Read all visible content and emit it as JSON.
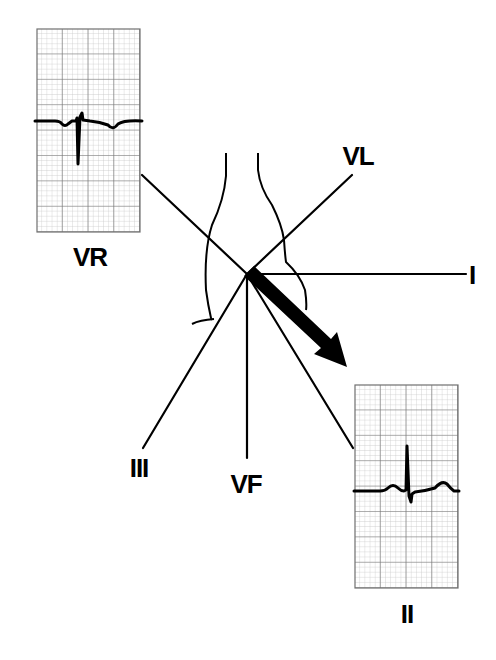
{
  "diagram": {
    "center": [
      247,
      272
    ],
    "leads": [
      {
        "name": "I",
        "label": "I",
        "end": [
          466,
          274
        ],
        "label_pos": [
          471,
          275
        ]
      },
      {
        "name": "VL",
        "label": "VL",
        "end": [
          352,
          175
        ],
        "label_pos": [
          358,
          156
        ]
      },
      {
        "name": "VR",
        "label": "VR",
        "end": [
          142,
          175
        ],
        "label_pos": [
          90,
          258
        ]
      },
      {
        "name": "II",
        "label": "II",
        "end": [
          353,
          448
        ],
        "label_pos": [
          407,
          614
        ]
      },
      {
        "name": "III",
        "label": "III",
        "end": [
          143,
          448
        ],
        "label_pos": [
          139,
          468
        ]
      },
      {
        "name": "VF",
        "label": "VF",
        "end": [
          247,
          458
        ],
        "label_pos": [
          247,
          485
        ]
      }
    ],
    "axis_arrow": {
      "from": [
        250,
        278
      ],
      "to": [
        347,
        366
      ],
      "color": "#000000"
    },
    "ecg_strips": [
      {
        "lead": "VR",
        "label": "VR",
        "box": [
          37,
          29,
          103,
          203
        ],
        "deflection": "negative QRS, inverted P and T"
      },
      {
        "lead": "II",
        "label": "II",
        "box": [
          355,
          385,
          103,
          203
        ],
        "deflection": "positive QRS, upright P and T"
      }
    ],
    "colors": {
      "grid_minor": "#bdbdbd",
      "grid_major": "#6e6e6e",
      "line": "#000000",
      "background": "#ffffff"
    }
  }
}
